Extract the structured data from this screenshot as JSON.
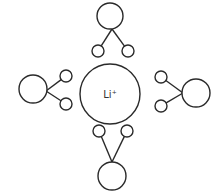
{
  "diagram": {
    "type": "coordination-complex",
    "center_ion": {
      "symbol": "Li",
      "charge": "+",
      "cx": 110,
      "cy": 94,
      "r": 30
    },
    "ligands": [
      {
        "id": "top",
        "body": {
          "cx": 110,
          "cy": 16,
          "r": 13
        },
        "junction": {
          "x": 112,
          "y": 29
        },
        "atoms": [
          {
            "cx": 98,
            "cy": 51,
            "r": 6
          },
          {
            "cx": 128,
            "cy": 51,
            "r": 6
          }
        ]
      },
      {
        "id": "left",
        "body": {
          "cx": 33,
          "cy": 89,
          "r": 14
        },
        "junction": {
          "x": 46,
          "y": 91
        },
        "atoms": [
          {
            "cx": 66,
            "cy": 76,
            "r": 6
          },
          {
            "cx": 66,
            "cy": 104,
            "r": 6
          }
        ]
      },
      {
        "id": "right",
        "body": {
          "cx": 196,
          "cy": 93,
          "r": 14
        },
        "junction": {
          "x": 183,
          "y": 93
        },
        "atoms": [
          {
            "cx": 161,
            "cy": 77,
            "r": 6
          },
          {
            "cx": 161,
            "cy": 106,
            "r": 6
          }
        ]
      },
      {
        "id": "bottom",
        "body": {
          "cx": 112,
          "cy": 176,
          "r": 14
        },
        "junction": {
          "x": 112,
          "y": 162
        },
        "atoms": [
          {
            "cx": 99,
            "cy": 131,
            "r": 6
          },
          {
            "cx": 127,
            "cy": 131,
            "r": 6
          }
        ]
      }
    ],
    "colors": {
      "stroke": "#2a2a2a",
      "fill": "#ffffff",
      "text": "#333333"
    }
  }
}
